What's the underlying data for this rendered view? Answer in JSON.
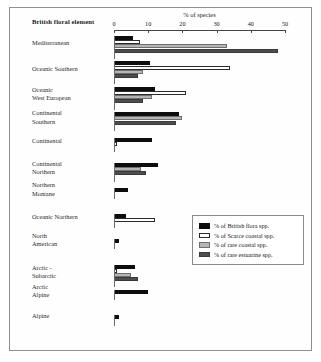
{
  "figure": {
    "category_header": "British floral element",
    "legend_title": ""
  },
  "chart_data": {
    "type": "bar",
    "orientation": "horizontal",
    "title": "% of species",
    "xlabel": "% of species",
    "ylabel": "British floral element",
    "xlim": [
      0,
      50
    ],
    "xticks": [
      0,
      10,
      20,
      30,
      40,
      50
    ],
    "xtick_labels": [
      "0",
      "10",
      "20",
      "30",
      "40",
      "50"
    ],
    "grid": false,
    "legend_position": "inside-right",
    "categories": [
      "Mediterranean",
      "Oceanic Southern",
      "Oceanic West European",
      "Continental Southern",
      "Continental",
      "Continental Northern",
      "Northern Montane",
      "Oceanic Northern",
      "North American",
      "Arctic - Subarctic",
      "Arctic Alpine",
      "Alpine"
    ],
    "category_labels_wrapped": [
      [
        "Mediterranean"
      ],
      [
        "Oceanic Southern"
      ],
      [
        "Oceanic",
        "West European"
      ],
      [
        "Continental",
        "Southern"
      ],
      [
        "Continental"
      ],
      [
        "Continental",
        "Northern"
      ],
      [
        "Northern",
        "Montane"
      ],
      [
        "Oceanic Northern"
      ],
      [
        "North",
        "American"
      ],
      [
        "Arctic -",
        "Subarctic"
      ],
      [
        "Arctic",
        "Alpine"
      ],
      [
        "Alpine"
      ]
    ],
    "series": [
      {
        "name": "% of British flora spp.",
        "color": "#0d0d0d",
        "values": [
          5.5,
          10.5,
          12.0,
          19.0,
          11.0,
          13.0,
          4.0,
          3.5,
          1.5,
          6.0,
          10.0,
          1.5
        ]
      },
      {
        "name": "% of Scarce coastal spp.",
        "color": "#ffffff",
        "values": [
          7.5,
          34.0,
          21.0,
          0.0,
          1.0,
          0.0,
          0.0,
          12.0,
          0.0,
          1.0,
          0.0,
          0.0
        ]
      },
      {
        "name": "% of rare coastal spp.",
        "color": "#b5b5b5",
        "values": [
          33.0,
          8.5,
          11.0,
          20.0,
          0.0,
          8.0,
          0.0,
          0.0,
          0.0,
          5.0,
          0.0,
          0.0
        ]
      },
      {
        "name": "% of rare estuarine spp.",
        "color": "#4d4d4d",
        "values": [
          48.0,
          7.0,
          8.5,
          18.0,
          0.0,
          9.5,
          0.0,
          0.0,
          0.0,
          7.0,
          0.0,
          0.0
        ]
      }
    ]
  }
}
